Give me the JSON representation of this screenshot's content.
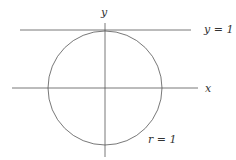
{
  "diagram": {
    "labels": {
      "y_axis": "y",
      "x_axis": "x",
      "tangent_line": "y = 1",
      "circle_radius": "r = 1"
    },
    "colors": {
      "stroke": "#555555",
      "text": "#333333"
    }
  }
}
